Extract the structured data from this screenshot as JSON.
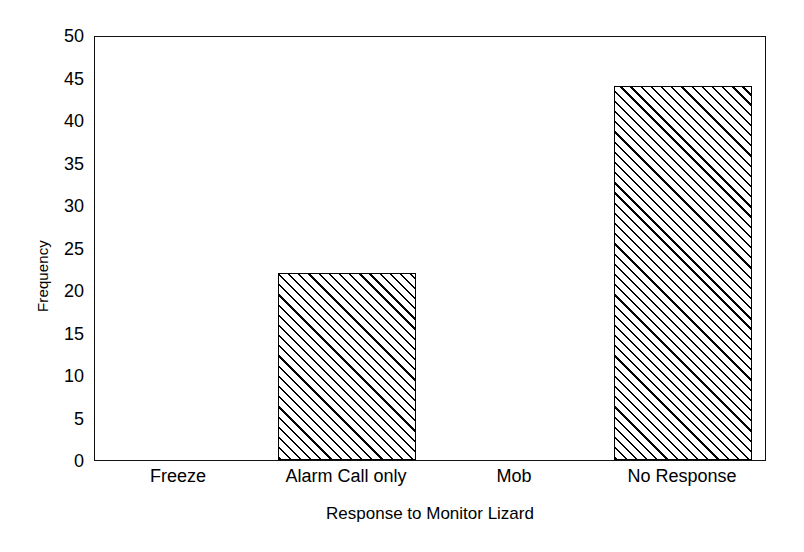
{
  "chart_data": {
    "type": "bar",
    "title": "",
    "xlabel": "Response to Monitor Lizard",
    "ylabel": "Frequency",
    "categories": [
      "Freeze",
      "Alarm Call only",
      "Mob",
      "No Response"
    ],
    "values": [
      0,
      22,
      0,
      44
    ],
    "ylim": [
      0,
      50
    ],
    "ytick_values": [
      0,
      5,
      10,
      15,
      20,
      25,
      30,
      35,
      40,
      45,
      50
    ],
    "ytick_labels": [
      "0",
      "5",
      "10",
      "15",
      "20",
      "25",
      "30",
      "35",
      "40",
      "45",
      "50"
    ],
    "grid": false,
    "legend": null,
    "bar_fill": "diagonal-hatch",
    "bar_edge_color": "#000000",
    "background_color": "#ffffff",
    "axis_color": "#111111"
  }
}
